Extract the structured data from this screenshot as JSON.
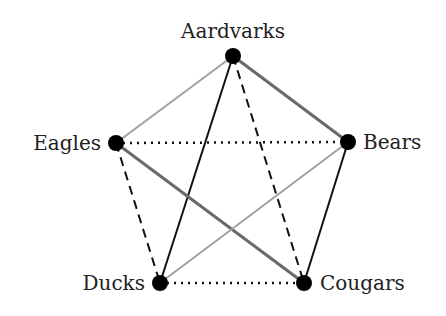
{
  "diagram": {
    "type": "complete-graph-k5",
    "nodes": [
      {
        "id": "A",
        "label": "Aardvarks",
        "x": 233,
        "y": 56,
        "label_x": 233,
        "label_y": 38,
        "anchor": "middle"
      },
      {
        "id": "B",
        "label": "Bears",
        "x": 348,
        "y": 142,
        "label_x": 363,
        "label_y": 149,
        "anchor": "start"
      },
      {
        "id": "C",
        "label": "Cougars",
        "x": 304,
        "y": 283,
        "label_x": 320,
        "label_y": 290,
        "anchor": "start"
      },
      {
        "id": "D",
        "label": "Ducks",
        "x": 160,
        "y": 283,
        "label_x": 145,
        "label_y": 290,
        "anchor": "end"
      },
      {
        "id": "E",
        "label": "Eagles",
        "x": 116,
        "y": 143,
        "label_x": 101,
        "label_y": 150,
        "anchor": "end"
      }
    ],
    "edges": [
      {
        "from": "A",
        "to": "E",
        "style": "solid",
        "color": "#a0a0a0",
        "width": 2
      },
      {
        "from": "A",
        "to": "B",
        "style": "solid",
        "color": "#6a6a6a",
        "width": 3
      },
      {
        "from": "A",
        "to": "D",
        "style": "solid",
        "color": "#111111",
        "width": 2
      },
      {
        "from": "A",
        "to": "C",
        "style": "dashed",
        "color": "#111111",
        "width": 2
      },
      {
        "from": "E",
        "to": "B",
        "style": "dotted",
        "color": "#111111",
        "width": 2.5
      },
      {
        "from": "E",
        "to": "D",
        "style": "dashed",
        "color": "#111111",
        "width": 2
      },
      {
        "from": "E",
        "to": "C",
        "style": "solid",
        "color": "#6a6a6a",
        "width": 3
      },
      {
        "from": "B",
        "to": "D",
        "style": "solid",
        "color": "#a0a0a0",
        "width": 2
      },
      {
        "from": "B",
        "to": "C",
        "style": "solid",
        "color": "#111111",
        "width": 2
      },
      {
        "from": "D",
        "to": "C",
        "style": "dotted",
        "color": "#111111",
        "width": 2.5
      }
    ],
    "node_radius": 8,
    "node_color": "#000000"
  }
}
